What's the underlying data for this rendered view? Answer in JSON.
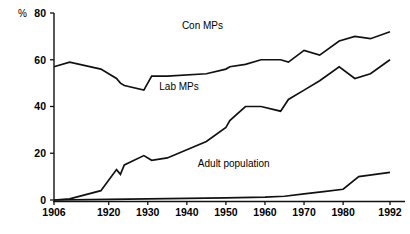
{
  "chart_data": {
    "type": "line",
    "title": "",
    "subtitle": "",
    "xlabel": "",
    "ylabel": "%",
    "xlim": [
      1906,
      1992
    ],
    "ylim": [
      0,
      80
    ],
    "grid": false,
    "legend_position": "inline-annotations",
    "y_ticks": [
      0,
      20,
      40,
      60,
      80
    ],
    "y_tick_labels": [
      "0",
      "20",
      "40",
      "60",
      "80"
    ],
    "x_ticks": [
      1906,
      1920,
      1930,
      1940,
      1950,
      1960,
      1970,
      1980,
      1992
    ],
    "x_tick_labels": [
      "1906",
      "1920",
      "1930",
      "1940",
      "1950",
      "1960",
      "1970",
      "1980",
      "1992"
    ],
    "series": [
      {
        "name": "Con MPs",
        "label": "Con MPs",
        "color": "#111111",
        "x": [
          1906,
          1910,
          1918,
          1922,
          1923,
          1924,
          1929,
          1931,
          1935,
          1945,
          1950,
          1951,
          1955,
          1959,
          1964,
          1966,
          1970,
          1974,
          1979,
          1983,
          1987,
          1992
        ],
        "y": [
          57,
          59,
          56,
          52,
          50,
          49,
          47,
          53,
          53,
          54,
          56,
          57,
          58,
          60,
          60,
          59,
          64,
          62,
          68,
          70,
          69,
          72
        ]
      },
      {
        "name": "Lab MPs",
        "label": "Lab MPs",
        "color": "#111111",
        "x": [
          1906,
          1910,
          1918,
          1922,
          1923,
          1924,
          1929,
          1931,
          1935,
          1945,
          1950,
          1951,
          1955,
          1959,
          1964,
          1966,
          1970,
          1974,
          1979,
          1983,
          1987,
          1992
        ],
        "y": [
          0,
          0.5,
          4,
          13,
          11,
          15,
          19,
          17,
          18,
          25,
          31,
          34,
          40,
          40,
          38,
          43,
          47,
          51,
          57,
          52,
          54,
          60
        ]
      },
      {
        "name": "Adult population",
        "label": "Adult population",
        "color": "#111111",
        "x": [
          1906,
          1920,
          1930,
          1940,
          1950,
          1960,
          1965,
          1970,
          1975,
          1980,
          1984,
          1992
        ],
        "y": [
          0,
          0.3,
          0.5,
          0.7,
          0.9,
          1.2,
          1.6,
          2.6,
          3.6,
          4.6,
          10.0,
          11.8
        ]
      }
    ],
    "annotations": [
      {
        "text": "Con MPs",
        "x": 1944,
        "y": 73
      },
      {
        "text": "Lab MPs",
        "x": 1938,
        "y": 47
      },
      {
        "text": "Adult population",
        "x": 1952,
        "y": 14
      }
    ]
  },
  "axes": {
    "y_unit_label": "%"
  }
}
